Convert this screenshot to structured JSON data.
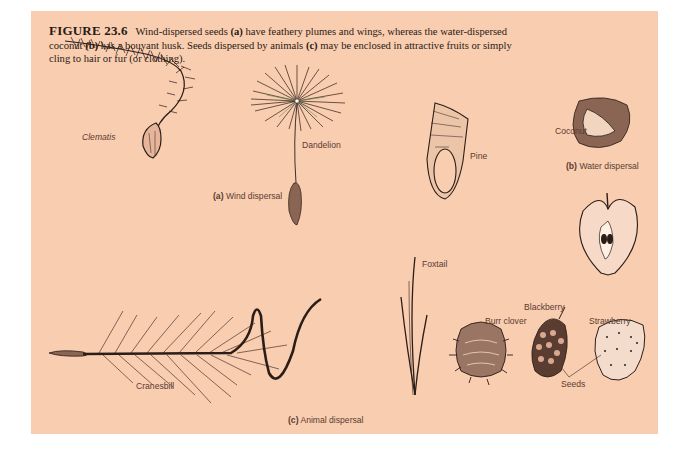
{
  "figure": {
    "number_label": "FIGURE",
    "number": "23.6",
    "caption_parts": {
      "p1": " Wind-dispersed seeds ",
      "a": "(a)",
      "p2": " have feathery plumes and wings, whereas the water-dispersed coconut ",
      "b": "(b)",
      "p3": " has a bouyant husk. Seeds dispersed by animals ",
      "c": "(c)",
      "p4": " may be enclosed in attractive fruits or simply cling to hair or fur (or clothing)."
    },
    "background_color": "#f9cdb0"
  },
  "sections": {
    "wind": {
      "letter": "(a)",
      "title": "Wind dispersal",
      "specimens": [
        "Clematis",
        "Dandelion",
        "Pine"
      ]
    },
    "water": {
      "letter": "(b)",
      "title": "Water dispersal",
      "specimens": [
        "Coconut"
      ]
    },
    "animal": {
      "letter": "(c)",
      "title": "Animal dispersal",
      "specimens": [
        "Cranesbill",
        "Foxtail",
        "Burr clover",
        "Blackberry",
        "Strawberry"
      ],
      "pointer_label": "Seeds"
    }
  },
  "labels": {
    "clematis": "Clematis",
    "dandelion": "Dandelion",
    "pine": "Pine",
    "coconut": "Coconut",
    "cranesbill": "Cranesbill",
    "foxtail": "Foxtail",
    "burr_clover": "Burr clover",
    "blackberry": "Blackberry",
    "strawberry": "Strawberry",
    "seeds": "Seeds"
  }
}
